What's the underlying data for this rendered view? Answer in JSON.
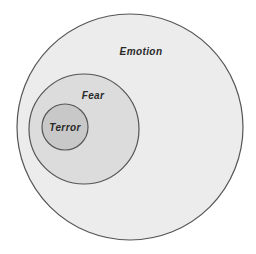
{
  "diagram": {
    "type": "nested-venn",
    "background": "#ffffff",
    "stroke_color": "#555555",
    "sets": [
      {
        "id": "emotion",
        "label": "Emotion",
        "fill": "#ececec",
        "cx": 130,
        "cy": 127,
        "r": 113,
        "label_x": 141,
        "label_y": 55
      },
      {
        "id": "fear",
        "label": "Fear",
        "fill": "#dcdcdc",
        "cx": 84,
        "cy": 129,
        "r": 55,
        "label_x": 93,
        "label_y": 99
      },
      {
        "id": "terror",
        "label": "Terror",
        "fill": "#c8c8c8",
        "cx": 65,
        "cy": 127,
        "r": 23,
        "label_x": 65,
        "label_y": 131
      }
    ],
    "relationship": "Terror ⊂ Fear ⊂ Emotion"
  }
}
